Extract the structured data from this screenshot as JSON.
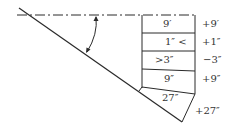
{
  "diagram": {
    "stroke_color": "#2a2a2a",
    "rows": [
      {
        "cell": "9′",
        "side": "+9′"
      },
      {
        "cell": "1″ <",
        "side": "+1″"
      },
      {
        "cell": ">3″",
        "side": "−3″"
      },
      {
        "cell": "9″",
        "side": "+9″"
      },
      {
        "cell": "27″",
        "side": "+27″"
      }
    ]
  }
}
